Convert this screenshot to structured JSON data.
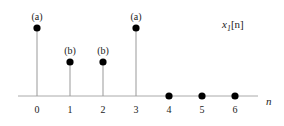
{
  "chart_data": {
    "type": "stem",
    "title": "x1[n]",
    "signal_label": "x",
    "signal_subscript": "1",
    "signal_arg": "[n]",
    "xlabel": "n",
    "ylabel": "",
    "x": [
      0,
      1,
      2,
      3,
      4,
      5,
      6
    ],
    "values": [
      "a",
      "b",
      "b",
      "a",
      0,
      0,
      0
    ],
    "relative_heights": [
      2,
      1,
      1,
      2,
      0,
      0,
      0
    ],
    "annotations": [
      "(a)",
      "(b)",
      "(b)",
      "(a)",
      "",
      "",
      ""
    ],
    "tick_labels": [
      "0",
      "1",
      "2",
      "3",
      "4",
      "5",
      "6"
    ],
    "grid": false
  },
  "colors": {
    "axis": "#aaaaaa",
    "stem": "#999999",
    "marker": "#000000",
    "text": "#222222"
  }
}
